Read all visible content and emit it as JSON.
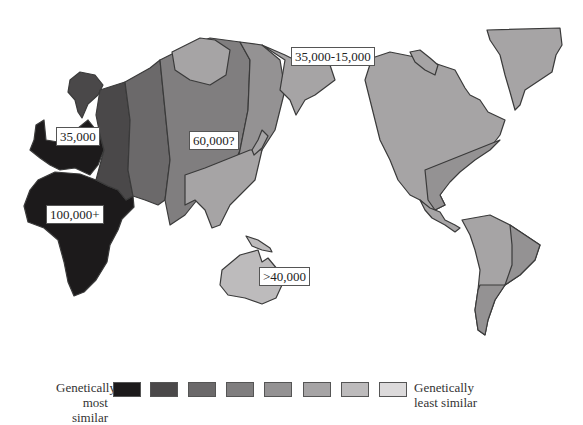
{
  "map": {
    "title": "Genetic similarity and migration dates of human populations",
    "labels": [
      {
        "id": "europe",
        "text": "35,000"
      },
      {
        "id": "africa",
        "text": "100,000+"
      },
      {
        "id": "asia",
        "text": "60,000?"
      },
      {
        "id": "beringia",
        "text": "35,000-15,000"
      },
      {
        "id": "australia",
        "text": ">40,000"
      }
    ],
    "colors": {
      "level1": "#1c1a1b",
      "level2": "#4a4849",
      "level3": "#6b696a",
      "level4": "#807e7f",
      "level5": "#949293",
      "level6": "#a6a4a5",
      "level7": "#bdbbbc",
      "level8": "#dcdadb",
      "outline": "#3a3a3a"
    }
  },
  "legend": {
    "left_line1": "Genetically",
    "left_line2": "most similar",
    "right_line1": "Genetically",
    "right_line2": "least similar",
    "swatches": [
      "#1c1a1b",
      "#4a4849",
      "#6b696a",
      "#807e7f",
      "#949293",
      "#a6a4a5",
      "#bdbbbc",
      "#dcdadb"
    ]
  }
}
